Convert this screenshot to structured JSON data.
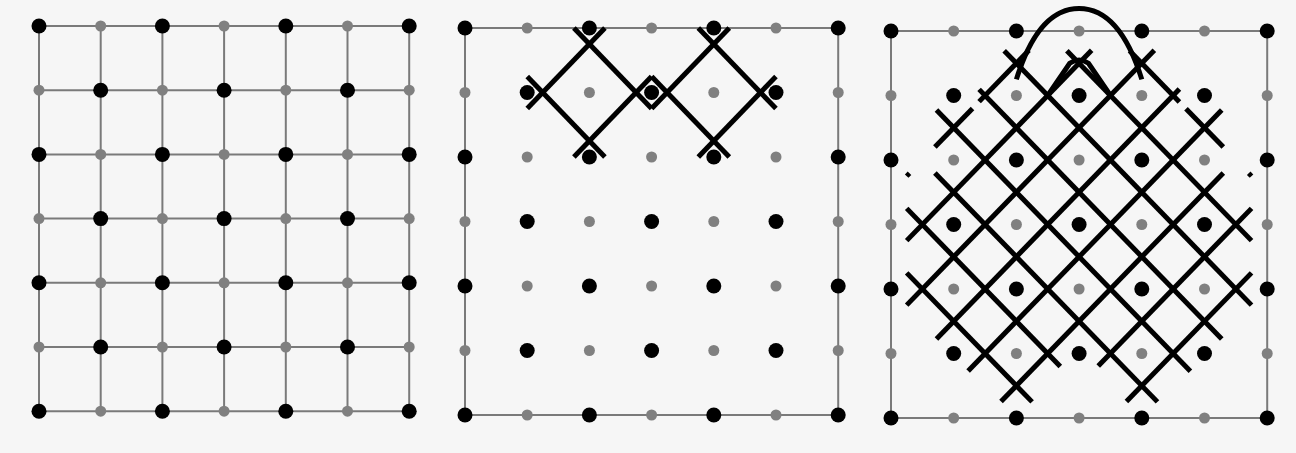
{
  "figure": {
    "background": "#f6f6f6",
    "colors": {
      "grid_line": "#7a7a7a",
      "dot_black": "#000000",
      "dot_gray": "#808080",
      "stroke": "#000000"
    },
    "dot_pattern": "Dots at grid points (i,j), i,j in 0..6. Black when i+j even, gray when odd.",
    "panels": [
      {
        "id": "panel-grid",
        "label": "Full square grid with 7x7 dot lattice",
        "origin": [
          39,
          26
        ],
        "step": [
          61.7,
          64.2
        ],
        "grid_lines": "full",
        "border_only": false
      },
      {
        "id": "panel-start",
        "label": "Dot lattice with two starting diamond motifs",
        "origin": [
          465,
          28
        ],
        "step": [
          62.2,
          64.5
        ],
        "grid_lines": "border",
        "motifs": [
          {
            "center": [
              2,
              1
            ],
            "half": 0.75,
            "tail": 0.25
          },
          {
            "center": [
              4,
              1
            ],
            "half": 0.75,
            "tail": 0.25
          }
        ]
      },
      {
        "id": "panel-complete",
        "label": "Completed kolam lattice with top loop",
        "origin": [
          891,
          31
        ],
        "step": [
          62.7,
          64.5
        ],
        "grid_lines": "border"
      }
    ]
  }
}
